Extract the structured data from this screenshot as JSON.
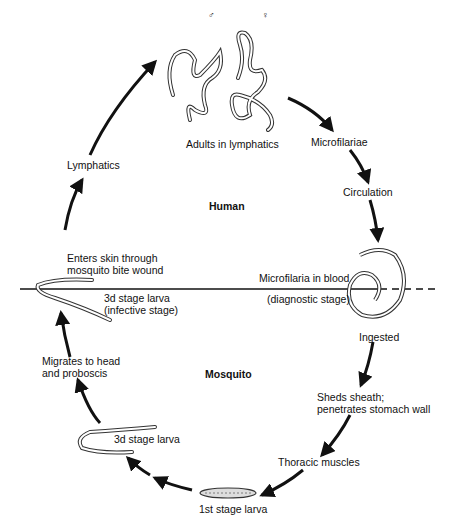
{
  "diagram": {
    "regions": {
      "human": "Human",
      "mosquito": "Mosquito"
    },
    "symbols": {
      "male": "♂",
      "female": "♀"
    },
    "stages": [
      {
        "id": "adults",
        "label": "Adults in lymphatics"
      },
      {
        "id": "microfilariae",
        "label": "Microfilariae"
      },
      {
        "id": "circulation",
        "label": "Circulation"
      },
      {
        "id": "microfilaria_blood",
        "label": "Microfilaria in blood",
        "sublabel": "(diagnostic stage)"
      },
      {
        "id": "ingested",
        "label": "Ingested"
      },
      {
        "id": "sheds_sheath",
        "label": "Sheds sheath;\npenetrates stomach wall"
      },
      {
        "id": "thoracic",
        "label": "Thoracic muscles"
      },
      {
        "id": "first_stage",
        "label": "1st stage larva"
      },
      {
        "id": "third_stage",
        "label": "3d stage larva"
      },
      {
        "id": "migrates",
        "label": "Migrates to head\nand proboscis"
      },
      {
        "id": "infective",
        "label": "3d stage larva\n(infective stage)"
      },
      {
        "id": "enters_skin",
        "label": "Enters skin through\nmosquito bite wound"
      },
      {
        "id": "lymphatics",
        "label": "Lymphatics"
      }
    ],
    "colors": {
      "ink": "#111111",
      "background": "#ffffff"
    }
  }
}
